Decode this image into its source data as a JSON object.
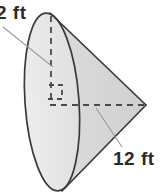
{
  "figure": {
    "shape": "cone",
    "orientation": "apex-right",
    "labels": {
      "radius": "2 ft",
      "height": "12 ft"
    },
    "units": "ft",
    "measurements": [
      {
        "name": "radius",
        "value": 2,
        "unit": "ft",
        "display": "2 ft"
      },
      {
        "name": "height",
        "value": 12,
        "unit": "ft",
        "display": "12 ft"
      }
    ],
    "markers": {
      "right_angle": "right-angle-marker"
    },
    "colors": {
      "outline": "#3a3a3a",
      "base_fill": "#e8e8e8",
      "body_fill": "#d9d9d9",
      "dashed": "#4a4a4a",
      "leader": "#8a8a8a",
      "text": "#2b2b2b",
      "background": "#ffffff"
    }
  }
}
